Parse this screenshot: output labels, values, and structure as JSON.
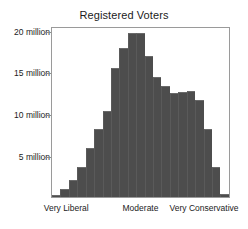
{
  "chart_data": {
    "type": "bar",
    "title": "Registered Voters",
    "xlabel": "",
    "ylabel": "",
    "grid": false,
    "legend": null,
    "ylim": [
      0,
      20.6
    ],
    "ytick_values": [
      5,
      10,
      15,
      20
    ],
    "ytick_labels": [
      "5 million",
      "10 million",
      "15 million",
      "20 million"
    ],
    "y_unit": "million",
    "xtick_labels": [
      "Very Liberal",
      "Moderate",
      "Very Conservative"
    ],
    "xtick_positions": [
      0.085,
      0.5,
      0.855
    ],
    "bar_color": "#4d4d4d",
    "categories": [
      "b1",
      "b2",
      "b3",
      "b4",
      "b5",
      "b6",
      "b7",
      "b8",
      "b9",
      "b10",
      "b11",
      "b12",
      "b13",
      "b14",
      "b15",
      "b16",
      "b17",
      "b18",
      "b19",
      "b20",
      "b21"
    ],
    "values": [
      0.3,
      1.0,
      2.0,
      3.6,
      5.9,
      8.2,
      10.4,
      15.5,
      18.0,
      19.7,
      19.7,
      17.0,
      14.5,
      13.4,
      12.5,
      12.7,
      12.8,
      11.7,
      8.2,
      3.6,
      0.4
    ]
  }
}
